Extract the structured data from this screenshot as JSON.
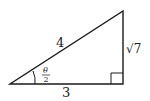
{
  "diagram": {
    "type": "right-triangle",
    "colors": {
      "stroke": "#1a1a1a",
      "background": "#ffffff"
    },
    "vertices": {
      "left": [
        10,
        84
      ],
      "right_angle": [
        123,
        84
      ],
      "top": [
        123,
        11
      ]
    },
    "labels": {
      "hypotenuse": "4",
      "vertical_leg": "√7",
      "horizontal_leg": "3",
      "angle_numerator": "θ",
      "angle_denominator": "2"
    }
  }
}
